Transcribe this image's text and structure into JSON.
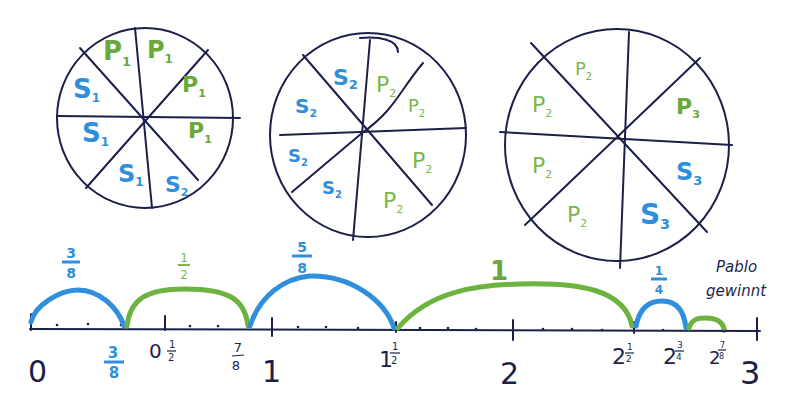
{
  "colors": {
    "ink": "#1c1f4a",
    "blue": "#2f8fdc",
    "green": "#6db33f"
  },
  "circles": [
    {
      "id": "circle-1",
      "segments": [
        "P1",
        "P1",
        "P1",
        "P1",
        "S2",
        "S1",
        "S1",
        "S1"
      ]
    },
    {
      "id": "circle-2",
      "segments": [
        "P2",
        "P2",
        "P2",
        "P2",
        "S2",
        "S2",
        "S2",
        "S2"
      ]
    },
    {
      "id": "circle-3",
      "segments": [
        "P2",
        "",
        "P3",
        "S3",
        "S3",
        "P2",
        "P2",
        "P2"
      ]
    }
  ],
  "labels": {
    "c1": {
      "p1a": "P",
      "p1a_sub": "1",
      "p1b": "P",
      "p1b_sub": "1",
      "p1c": "P",
      "p1c_sub": "1",
      "p1d": "P",
      "p1d_sub": "1",
      "s1a": "S",
      "s1a_sub": "1",
      "s1b": "S",
      "s1b_sub": "1",
      "s1c": "S",
      "s1c_sub": "1",
      "s2": "S",
      "s2_sub": "2"
    },
    "c2": {
      "s2a": "S",
      "s2a_sub": "2",
      "s2b": "S",
      "s2b_sub": "2",
      "s2c": "S",
      "s2c_sub": "2",
      "s2d": "S",
      "s2d_sub": "2",
      "p2a": "P",
      "p2a_sub": "2",
      "p2b": "P",
      "p2b_sub": "2",
      "p2c": "P",
      "p2c_sub": "2",
      "p2d": "P",
      "p2d_sub": "2"
    },
    "c3": {
      "p2a": "P",
      "p2a_sub": "2",
      "p2b": "P",
      "p2b_sub": "2",
      "p2c": "P",
      "p2c_sub": "2",
      "p2d": "P",
      "p2d_sub": "2",
      "p3": "P",
      "p3_sub": "3",
      "s3a": "S",
      "s3a_sub": "3",
      "s3b": "S",
      "s3b_sub": "3"
    }
  },
  "number_line": {
    "ticks": [
      {
        "label": "0"
      },
      {
        "label_num": "3",
        "label_den": "8"
      },
      {
        "label": "0",
        "frac_num": "1",
        "frac_den": "2"
      },
      {
        "label_num": "7",
        "label_den": "8"
      },
      {
        "label": "1"
      },
      {
        "label": "1",
        "frac_num": "1",
        "frac_den": "2"
      },
      {
        "label": "2"
      },
      {
        "label": "2",
        "frac_num": "1",
        "frac_den": "2"
      },
      {
        "label": "2",
        "frac_num": "3",
        "frac_den": "4"
      },
      {
        "label": "2",
        "frac_num": "7",
        "frac_den": "8"
      },
      {
        "label": "3"
      }
    ],
    "jumps": [
      {
        "player": "S",
        "num": "3",
        "den": "8"
      },
      {
        "player": "P",
        "num": "1",
        "den": "2"
      },
      {
        "player": "S",
        "num": "5",
        "den": "8"
      },
      {
        "player": "P",
        "label": "1"
      },
      {
        "player": "S",
        "num": "1",
        "den": "4"
      },
      {
        "player": "P",
        "label": ""
      }
    ]
  },
  "note": {
    "line1": "Pablo",
    "line2": "gewinnt"
  }
}
